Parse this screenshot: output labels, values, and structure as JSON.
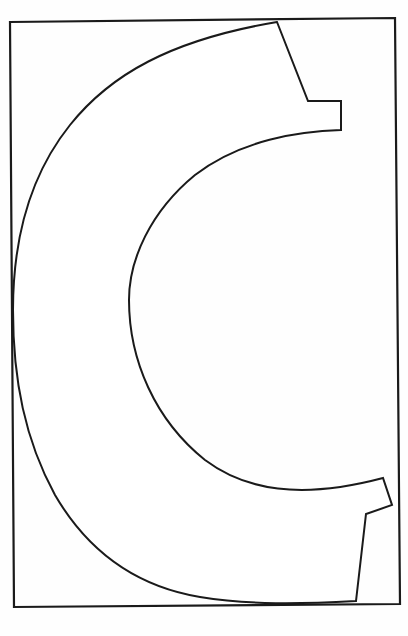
{
  "figure": {
    "letter": "C",
    "stroke_color": "#1a1a1a",
    "background_color": "#fefefe",
    "caption_text": ""
  }
}
